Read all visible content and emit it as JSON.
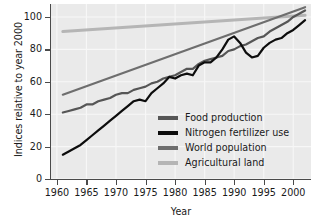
{
  "chart_data": {
    "type": "line",
    "title": "",
    "xlabel": "Year",
    "ylabel": "Indices relative to year 2000",
    "xlim": [
      1959,
      2003
    ],
    "ylim": [
      0,
      108
    ],
    "xticks": [
      1960,
      1965,
      1970,
      1975,
      1980,
      1985,
      1990,
      1995,
      2000
    ],
    "yticks": [
      0,
      20,
      40,
      60,
      80,
      100
    ],
    "grid": true,
    "legend_position": "center-right-inside",
    "panel_background": "#eaeaea",
    "gridline_color": "#f7f7f7",
    "series": [
      {
        "name": "Food production",
        "color": "#565656",
        "width": 2.2,
        "x": [
          1961,
          1962,
          1963,
          1964,
          1965,
          1966,
          1967,
          1968,
          1969,
          1970,
          1971,
          1972,
          1973,
          1974,
          1975,
          1976,
          1977,
          1978,
          1979,
          1980,
          1981,
          1982,
          1983,
          1984,
          1985,
          1986,
          1987,
          1988,
          1989,
          1990,
          1991,
          1992,
          1993,
          1994,
          1995,
          1996,
          1997,
          1998,
          1999,
          2000,
          2001,
          2002
        ],
        "values": [
          41,
          42,
          43,
          44,
          46,
          46,
          48,
          49,
          50,
          52,
          53,
          53,
          55,
          56,
          57,
          59,
          60,
          62,
          63,
          64,
          66,
          68,
          68,
          71,
          73,
          74,
          75,
          76,
          79,
          80,
          82,
          83,
          85,
          87,
          88,
          91,
          93,
          95,
          97,
          100,
          102,
          104
        ]
      },
      {
        "name": "Nitrogen fertilizer use",
        "color": "#0d0d0d",
        "width": 2.2,
        "x": [
          1961,
          1962,
          1963,
          1964,
          1965,
          1966,
          1967,
          1968,
          1969,
          1970,
          1971,
          1972,
          1973,
          1974,
          1975,
          1976,
          1977,
          1978,
          1979,
          1980,
          1981,
          1982,
          1983,
          1984,
          1985,
          1986,
          1987,
          1988,
          1989,
          1990,
          1991,
          1992,
          1993,
          1994,
          1995,
          1996,
          1997,
          1998,
          1999,
          2000,
          2001,
          2002
        ],
        "values": [
          15,
          17,
          19,
          21,
          24,
          27,
          30,
          33,
          36,
          39,
          42,
          45,
          48,
          49,
          48,
          53,
          56,
          59,
          63,
          62,
          64,
          65,
          64,
          70,
          72,
          72,
          75,
          80,
          86,
          88,
          84,
          78,
          75,
          76,
          81,
          84,
          86,
          87,
          90,
          92,
          95,
          98
        ],
        "note": "peak near 1989-1990 then dip through 1993, recovery after"
      },
      {
        "name": "World population",
        "color": "#6e6e6e",
        "width": 2.2,
        "x": [
          1961,
          2002
        ],
        "values": [
          52,
          106
        ],
        "note": "near-linear increase"
      },
      {
        "name": "Agricultural land",
        "color": "#b5b5b5",
        "width": 3.0,
        "x": [
          1961,
          2002
        ],
        "values": [
          91,
          101
        ],
        "note": "gentle near-linear increase"
      }
    ]
  },
  "legend": {
    "items": [
      {
        "label": "Food production",
        "color": "#565656"
      },
      {
        "label": "Nitrogen fertilizer use",
        "color": "#0d0d0d"
      },
      {
        "label": "World population",
        "color": "#6e6e6e"
      },
      {
        "label": "Agricultural land",
        "color": "#b5b5b5"
      }
    ]
  }
}
